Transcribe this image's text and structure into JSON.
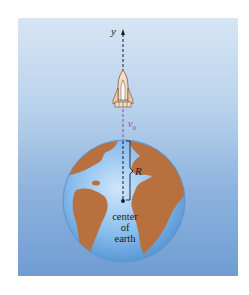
{
  "figure": {
    "axis_label": "y",
    "velocity_label": "v",
    "velocity_subscript": "0",
    "radius_label": "R",
    "center_label_lines": [
      "center",
      "of",
      "earth"
    ],
    "objects": [
      "rocket-icon",
      "earth-globe"
    ]
  },
  "colors": {
    "background_top": "#d6e5f4",
    "background_bottom": "#6f9dd2",
    "ocean": "#86bbec",
    "continents": "#b8703f",
    "axis_dashes": "#1a1a2e",
    "velocity_dashes": "#8a4fa3"
  }
}
